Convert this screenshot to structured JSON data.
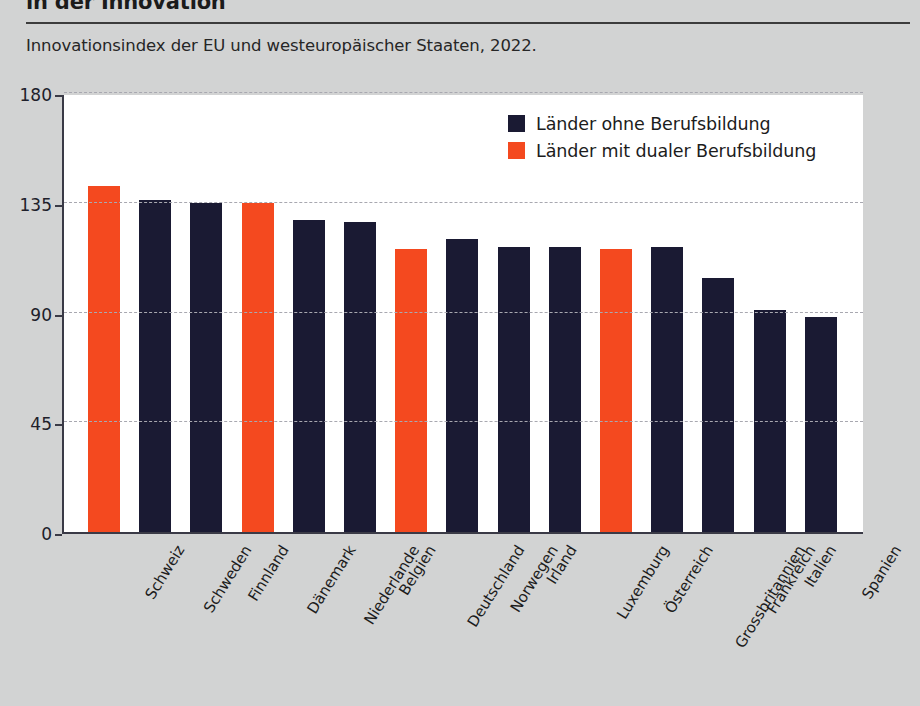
{
  "header": {
    "title": "in der Innovation",
    "subtitle": "Innovationsindex der EU und westeuropäischer Staaten, 2022."
  },
  "legend": {
    "position": "top-right",
    "items": [
      {
        "label": "Länder ohne Berufsbildung",
        "color": "#1a1a33"
      },
      {
        "label": "Länder mit dualer Berufsbildung",
        "color": "#f4491f"
      }
    ]
  },
  "colors": {
    "page_background": "#d2d3d3",
    "plot_background": "#ffffff",
    "axis": "#3a3a46",
    "grid": "#a8a8b0",
    "navy": "#1a1a33",
    "orange": "#f4491f",
    "text": "#1c1c1c"
  },
  "chart_data": {
    "type": "bar",
    "title": "in der Innovation",
    "subtitle": "Innovationsindex der EU und westeuropäischer Staaten, 2022.",
    "xlabel": "",
    "ylabel": "",
    "ylim": [
      0,
      180
    ],
    "yticks": [
      0,
      45,
      90,
      135,
      180
    ],
    "grid": true,
    "grid_axis": "y",
    "legend_position": "top-right",
    "categories": [
      "Schweiz",
      "Schweden",
      "Finnland",
      "Dänemark",
      "Niederlande",
      "Belgien",
      "Deutschland",
      "Norwegen",
      "Irland",
      "Luxemburg",
      "Österreich",
      "Grossbritannien",
      "Frankreich",
      "Italien",
      "Spanien"
    ],
    "values": [
      142,
      136,
      135,
      135,
      128,
      127,
      116,
      120,
      117,
      117,
      116,
      117,
      104,
      91,
      88
    ],
    "groups": [
      "dual",
      "ohne",
      "ohne",
      "dual",
      "ohne",
      "ohne",
      "dual",
      "ohne",
      "ohne",
      "ohne",
      "dual",
      "ohne",
      "ohne",
      "ohne",
      "ohne"
    ],
    "series": [
      {
        "name": "Länder ohne Berufsbildung",
        "color": "#1a1a33"
      },
      {
        "name": "Länder mit dualer Berufsbildung",
        "color": "#f4491f"
      }
    ]
  }
}
